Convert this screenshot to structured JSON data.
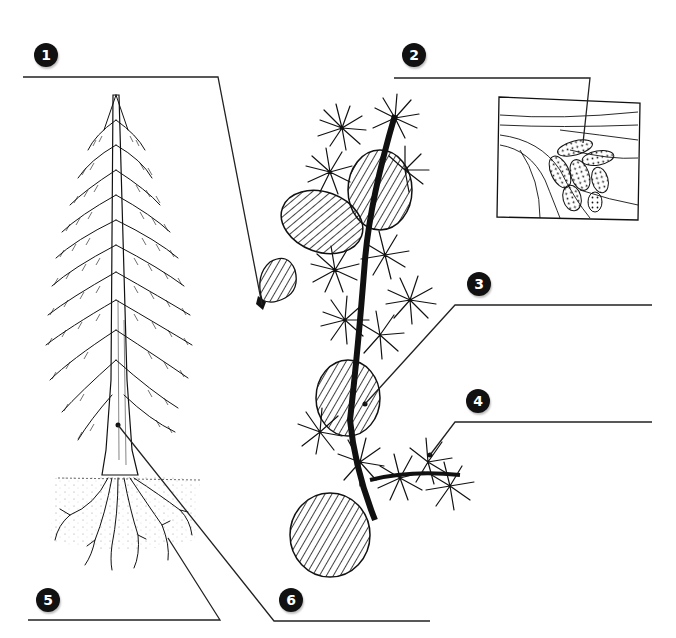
{
  "diagram": {
    "callouts": [
      {
        "number": "1",
        "target": "seed",
        "answer": ""
      },
      {
        "number": "2",
        "target": "male-cone-inset",
        "answer": ""
      },
      {
        "number": "3",
        "target": "female-cone",
        "answer": ""
      },
      {
        "number": "4",
        "target": "needle-cluster",
        "answer": ""
      },
      {
        "number": "5",
        "target": "roots",
        "answer": ""
      },
      {
        "number": "6",
        "target": "trunk",
        "answer": ""
      }
    ],
    "colors": {
      "ink": "#111111",
      "background": "#ffffff",
      "leader": "#222222"
    }
  }
}
